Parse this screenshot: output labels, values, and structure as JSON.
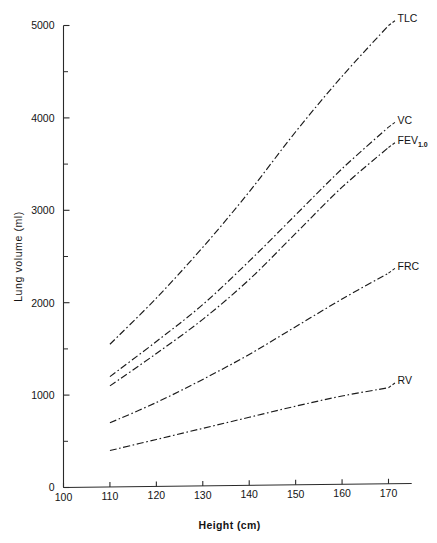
{
  "figure": {
    "background_color": "#ffffff",
    "ink_color": "#1b1b1b",
    "line_style": "dash-dot"
  },
  "axes": {
    "x": {
      "label": "Height (cm)",
      "unit": "cm",
      "min": 100,
      "max": 175,
      "ticks": [
        100,
        110,
        120,
        130,
        140,
        150,
        160,
        170
      ],
      "tick_labels": [
        "100",
        "110",
        "120",
        "130",
        "140",
        "150",
        "160",
        "170"
      ],
      "minor_tick_step": 0
    },
    "y": {
      "label": "Lung volume (ml)",
      "unit": "ml",
      "min": 0,
      "max": 5000,
      "ticks": [
        0,
        1000,
        2000,
        3000,
        4000,
        5000
      ],
      "tick_labels": [
        "0",
        "1000",
        "2000",
        "3000",
        "4000",
        "5000"
      ],
      "minor_ticks": [
        500,
        1500,
        2500,
        3500,
        4500
      ],
      "minor_tick_step": 500
    }
  },
  "chart_data": {
    "type": "line",
    "title": "",
    "subtitle": "",
    "xlabel": "Height (cm)",
    "ylabel": "Lung volume (ml)",
    "xlim": [
      100,
      175
    ],
    "ylim": [
      0,
      5000
    ],
    "grid": false,
    "legend": "inline-right-of-curve-ends",
    "x": [
      110,
      120,
      130,
      140,
      150,
      160,
      170
    ],
    "series": [
      {
        "name": "TLC",
        "label": "TLC",
        "label_x": 170,
        "label_y": 5000,
        "values": [
          1550,
          2050,
          2600,
          3200,
          3850,
          4450,
          5000
        ]
      },
      {
        "name": "VC",
        "label": "VC",
        "label_x": 170,
        "label_y": 3900,
        "values": [
          1200,
          1580,
          1980,
          2450,
          2950,
          3450,
          3900
        ]
      },
      {
        "name": "FEV1.0",
        "label": "FEV",
        "label_sub": "1.0",
        "label_x": 170,
        "label_y": 3680,
        "values": [
          1100,
          1450,
          1820,
          2250,
          2750,
          3250,
          3680
        ]
      },
      {
        "name": "FRC",
        "label": "FRC",
        "label_x": 170,
        "label_y": 2320,
        "values": [
          700,
          920,
          1170,
          1440,
          1740,
          2040,
          2320
        ]
      },
      {
        "name": "RV",
        "label": "RV",
        "label_x": 170,
        "label_y": 1080,
        "values": [
          400,
          520,
          640,
          760,
          880,
          990,
          1080
        ]
      }
    ]
  }
}
